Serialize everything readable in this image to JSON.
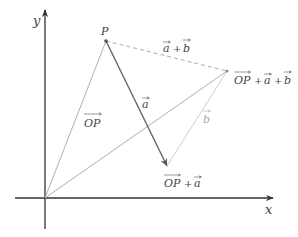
{
  "diagram": {
    "axes": {
      "x_label": "x",
      "y_label": "y",
      "color": "#333333"
    },
    "points": {
      "origin": {
        "x": 45,
        "y": 198
      },
      "P": {
        "x": 106,
        "y": 41,
        "label": "P"
      },
      "OP_plus_a": {
        "x": 167,
        "y": 166,
        "label": "OP + a"
      },
      "OP_plus_a_plus_b": {
        "x": 227,
        "y": 71,
        "label": "OP + a + b"
      }
    },
    "vectors": [
      {
        "id": "OP",
        "from": "origin",
        "to": "P",
        "label": "OP",
        "color": "#aaaaaa",
        "style": "solid"
      },
      {
        "id": "a",
        "from": "P",
        "to": "OP_plus_a",
        "label": "a",
        "color": "#666666",
        "style": "arrow"
      },
      {
        "id": "b",
        "from": "OP_plus_a",
        "to": "OP_plus_a_plus_b",
        "label": "b",
        "color": "#cccccc",
        "style": "solid"
      },
      {
        "id": "a_plus_b",
        "from": "P",
        "to": "OP_plus_a_plus_b",
        "label": "a + b",
        "color": "#aaaaaa",
        "style": "dashed"
      },
      {
        "id": "OP_a_b",
        "from": "origin",
        "to": "OP_plus_a_plus_b",
        "label": "",
        "color": "#aaaaaa",
        "style": "solid"
      }
    ],
    "labels": {
      "P": "P",
      "OP_vec": "OP",
      "a_vec": "a",
      "b_vec": "b",
      "a_plus_b_a": "a",
      "a_plus_b_plus": "+",
      "a_plus_b_b": "b",
      "op_a_OP": "OP",
      "op_a_plus": "+",
      "op_a_a": "a",
      "op_ab_OP": "OP",
      "op_ab_plus1": "+",
      "op_ab_a": "a",
      "op_ab_plus2": "+",
      "op_ab_b": "b"
    }
  }
}
